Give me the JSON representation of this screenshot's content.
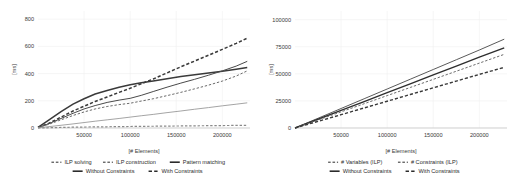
{
  "figure": {
    "background": "#ffffff",
    "grid_color": "#f0f0f0",
    "axis_color": "#b8b8b8"
  },
  "chart_data": [
    {
      "type": "line",
      "title": "",
      "xlabel": "[# Elements]",
      "ylabel": "[ms]",
      "xlim": [
        0,
        230000
      ],
      "ylim": [
        0,
        860
      ],
      "xticks": [
        50000,
        100000,
        150000,
        200000
      ],
      "xtick_labels": [
        "50000",
        "100000",
        "150000",
        "200000"
      ],
      "yticks": [
        0,
        200,
        400,
        600,
        800
      ],
      "ytick_labels": [
        "0",
        "200",
        "400",
        "600",
        "800"
      ],
      "grid": true,
      "legend_position": "below",
      "x": [
        0,
        12000,
        25000,
        38000,
        50000,
        62000,
        75000,
        88000,
        100000,
        112000,
        125000,
        140000,
        155000,
        170000,
        185000,
        200000,
        215000,
        227000
      ],
      "series": [
        {
          "name": "ILP solving / Without Constraints",
          "legend": "ILP solving",
          "style": "solid",
          "width": 1.5,
          "color": "#3a3a3a",
          "values": [
            5,
            60,
            120,
            175,
            215,
            250,
            275,
            300,
            318,
            332,
            345,
            362,
            378,
            392,
            405,
            418,
            432,
            445
          ]
        },
        {
          "name": "ILP solving / With Constraints",
          "legend": "ILP solving",
          "style": "dashed",
          "width": 1.5,
          "color": "#3a3a3a",
          "values": [
            4,
            35,
            80,
            125,
            160,
            195,
            228,
            262,
            292,
            325,
            360,
            405,
            450,
            492,
            535,
            578,
            622,
            660
          ]
        },
        {
          "name": "ILP construction / Without Constraints",
          "legend": "ILP construction",
          "style": "solid",
          "width": 1.0,
          "color": "#4a4a4a",
          "values": [
            3,
            32,
            70,
            108,
            140,
            165,
            188,
            205,
            218,
            240,
            268,
            300,
            330,
            358,
            388,
            420,
            455,
            490
          ]
        },
        {
          "name": "ILP construction / With Constraints",
          "legend": "ILP construction",
          "style": "dashed",
          "width": 1.0,
          "color": "#6a6a6a",
          "values": [
            3,
            28,
            60,
            92,
            118,
            140,
            158,
            172,
            182,
            198,
            215,
            238,
            262,
            288,
            315,
            345,
            382,
            420
          ]
        },
        {
          "name": "Pattern matching / Without Constraints",
          "legend": "Pattern matching",
          "style": "solid",
          "width": 0.9,
          "color": "#9a9a9a",
          "values": [
            1,
            10,
            20,
            30,
            40,
            50,
            60,
            70,
            80,
            90,
            100,
            113,
            125,
            138,
            150,
            163,
            175,
            185
          ]
        },
        {
          "name": "Pattern matching / With Constraints",
          "legend": "Pattern matching",
          "style": "dashed",
          "width": 1.2,
          "color": "#8a8a8a",
          "values": [
            0,
            2,
            4,
            6,
            7,
            8,
            9,
            10,
            11,
            12,
            13,
            14,
            15,
            16,
            17,
            18,
            19,
            20
          ]
        }
      ],
      "legend_rows": [
        [
          {
            "label": "ILP solving",
            "style": "dashed-thin"
          },
          {
            "label": "ILP construction",
            "style": "dashed-thin"
          },
          {
            "label": "Pattern matching",
            "style": "solid-thick"
          }
        ],
        [
          {
            "label": "Without Constraints",
            "style": "solid-thick"
          },
          {
            "label": "With Constraints",
            "style": "dashed-thick"
          }
        ]
      ]
    },
    {
      "type": "line",
      "title": "",
      "xlabel": "[# Elements]",
      "ylabel": "[ms]",
      "xlim": [
        0,
        230000
      ],
      "ylim": [
        0,
        108000
      ],
      "xticks": [
        50000,
        100000,
        150000,
        200000
      ],
      "xtick_labels": [
        "50000",
        "100000",
        "150000",
        "200000"
      ],
      "yticks": [
        0,
        25000,
        50000,
        75000,
        100000
      ],
      "ytick_labels": [
        "0",
        "25000",
        "50000",
        "75000",
        "100000"
      ],
      "grid": true,
      "legend_position": "below",
      "x": [
        0,
        25000,
        50000,
        75000,
        100000,
        125000,
        150000,
        175000,
        200000,
        227000
      ],
      "series": [
        {
          "name": "# Variables (ILP) / Without Constraints",
          "legend": "# Variables (ILP)",
          "style": "solid",
          "width": 1.0,
          "color": "#5a5a5a",
          "values": [
            0,
            9000,
            18000,
            27000,
            36000,
            45000,
            54000,
            63000,
            72000,
            82000
          ]
        },
        {
          "name": "# Constraints (ILP) / Without Constraints",
          "legend": "# Constraints (ILP)",
          "style": "solid",
          "width": 1.4,
          "color": "#2e2e2e",
          "values": [
            0,
            8100,
            16200,
            24400,
            32600,
            40800,
            49000,
            57200,
            65400,
            74000
          ]
        },
        {
          "name": "# Variables (ILP) / With Constraints",
          "legend": "# Variables (ILP)",
          "style": "dashed",
          "width": 1.0,
          "color": "#6a6a6a",
          "values": [
            0,
            7400,
            14900,
            22400,
            29900,
            37400,
            44900,
            52400,
            59900,
            68000
          ]
        },
        {
          "name": "# Constraints (ILP) / With Constraints",
          "legend": "# Constraints (ILP)",
          "style": "dashed",
          "width": 1.4,
          "color": "#3a3a3a",
          "values": [
            0,
            6100,
            12300,
            18500,
            24700,
            30900,
            37100,
            43300,
            49500,
            56000
          ]
        }
      ],
      "legend_rows": [
        [
          {
            "label": "# Variables (ILP)",
            "style": "dashed-thin"
          },
          {
            "label": "# Constraints (ILP)",
            "style": "dashed-thin"
          }
        ],
        [
          {
            "label": "Without Constraints",
            "style": "solid-thick"
          },
          {
            "label": "With Constraints",
            "style": "dashed-thick"
          }
        ]
      ]
    }
  ]
}
